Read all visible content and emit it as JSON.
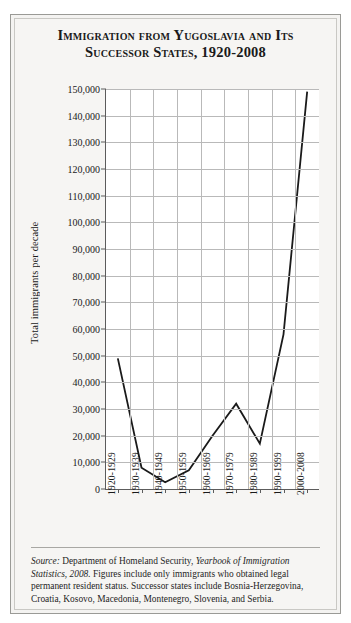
{
  "page_bleed_text": "",
  "figure": {
    "title": "Immigration from Yugoslavia and Its Successor States, 1920-2008",
    "source_label": "Source:",
    "source_text_1": " Department of Homeland Security, ",
    "source_italic": "Yearbook of Immigration Statistics, 2008.",
    "source_text_2": " Figures include only immigrants who obtained legal permanent resident status. Successor states include Bosnia-Herzegovina, Croatia, Kosovo, Macedonia, Montenegro, Slovenia, and Serbia."
  },
  "chart_data": {
    "type": "line",
    "title": "Immigration from Yugoslavia and Its Successor States, 1920-2008",
    "xlabel": "",
    "ylabel": "Total immigrants per decade",
    "categories": [
      "1920-1929",
      "1930-1939",
      "1940-1949",
      "1950-1959",
      "1960-1969",
      "1970-1979",
      "1980-1989",
      "1990-1999",
      "2000-2008"
    ],
    "values": [
      49000,
      8000,
      2500,
      7000,
      20000,
      32000,
      17000,
      58000,
      149000
    ],
    "ylim": [
      0,
      150000
    ],
    "ytick_step": 10000,
    "ytick_labels": [
      "0",
      "10,000",
      "20,000",
      "30,000",
      "40,000",
      "50,000",
      "60,000",
      "70,000",
      "80,000",
      "90,000",
      "100,000",
      "110,000",
      "120,000",
      "130,000",
      "140,000",
      "150,000"
    ],
    "grid": true,
    "legend": "none",
    "line_color": "#1a1a1a",
    "background_color": "#ffffff"
  }
}
